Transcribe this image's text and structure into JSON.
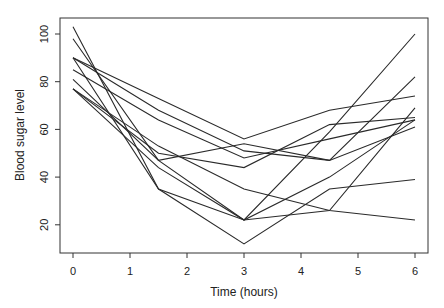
{
  "chart_data": {
    "type": "line",
    "title": "",
    "xlabel": "Time (hours)",
    "ylabel": "Blood sugar level",
    "x": [
      0,
      1.5,
      3,
      4.5,
      6
    ],
    "xlim": [
      -0.08,
      6.2
    ],
    "ylim": [
      8,
      106
    ],
    "xticks": [
      0,
      1,
      2,
      3,
      4,
      5,
      6
    ],
    "yticks": [
      20,
      40,
      60,
      80,
      100
    ],
    "grid": false,
    "legend": null,
    "line_color": "#2a2a2a",
    "series": [
      {
        "name": "subject-1",
        "values": [
          103,
          35,
          22,
          26,
          69
        ]
      },
      {
        "name": "subject-2",
        "values": [
          98,
          47,
          22,
          59,
          100
        ]
      },
      {
        "name": "subject-3",
        "values": [
          90,
          73,
          56,
          68,
          74
        ]
      },
      {
        "name": "subject-4",
        "values": [
          90,
          68,
          51,
          47,
          82
        ]
      },
      {
        "name": "subject-5",
        "values": [
          85,
          64,
          48,
          56,
          64
        ]
      },
      {
        "name": "subject-6",
        "values": [
          81,
          47,
          54,
          47,
          61
        ]
      },
      {
        "name": "subject-7",
        "values": [
          77,
          50,
          44,
          62,
          65
        ]
      },
      {
        "name": "subject-8",
        "values": [
          77,
          53,
          35,
          26,
          22
        ]
      },
      {
        "name": "subject-9",
        "values": [
          90,
          35,
          12,
          35,
          39
        ]
      },
      {
        "name": "subject-10",
        "values": [
          77,
          44,
          22,
          40,
          64
        ]
      }
    ]
  }
}
